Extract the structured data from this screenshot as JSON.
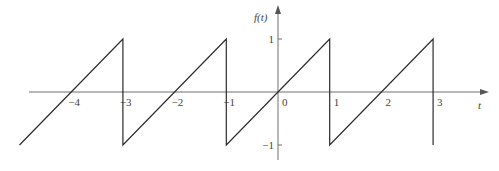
{
  "chart_data": {
    "type": "line",
    "title": "",
    "xlabel": "t",
    "ylabel": "f(t)",
    "x_ticks": [
      -4,
      -3,
      -2,
      -1,
      0,
      1,
      2,
      3
    ],
    "x_tick_labels": [
      "−4",
      "−3",
      "−2",
      "−1",
      "0",
      "1",
      "2",
      "3"
    ],
    "y_ticks": [
      1,
      -1
    ],
    "y_tick_labels": [
      "1",
      "−1"
    ],
    "xlim": [
      -5.0,
      4.0
    ],
    "ylim": [
      -1.2,
      1.3
    ],
    "grid": false,
    "legend": null,
    "series": [
      {
        "name": "f(t)",
        "x": [
          -5.0,
          -3,
          -3,
          -1,
          -1,
          1,
          1,
          3,
          3
        ],
        "y": [
          -1.0,
          1,
          -1,
          1,
          -1,
          1,
          -1,
          1,
          -1
        ]
      }
    ]
  },
  "labels": {
    "x_axis": "t",
    "y_axis": "f(t)"
  }
}
